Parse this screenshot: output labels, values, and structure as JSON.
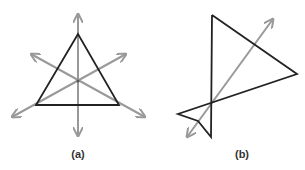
{
  "figures": [
    {
      "id": "a",
      "label": "(a)",
      "description": "Equilateral triangle with its three lines of symmetry drawn as double-headed gray arrows meeting at the centroid",
      "triangle": [
        [
          78,
          34
        ],
        [
          36,
          105
        ],
        [
          119,
          105
        ]
      ],
      "axes": [
        [
          [
            78,
            14
          ],
          [
            78,
            136
          ]
        ],
        [
          [
            12,
            117
          ],
          [
            126,
            54
          ]
        ],
        [
          [
            31,
            54
          ],
          [
            145,
            117
          ]
        ]
      ],
      "center": [
        78,
        81
      ]
    },
    {
      "id": "b",
      "label": "(b)",
      "description": "Irregular self-intersecting polygon (triangle with a small bowtie tail) with one double-headed gray arrow crossing it",
      "polygon": [
        [
          212,
          15
        ],
        [
          297,
          74
        ],
        [
          178,
          114
        ],
        [
          198,
          121
        ],
        [
          211,
          137
        ],
        [
          212,
          15
        ]
      ],
      "axes": [
        [
          [
            187,
            137
          ],
          [
            273,
            19
          ]
        ]
      ]
    }
  ],
  "colors": {
    "shape_stroke": "#222222",
    "axis_stroke": "#999999",
    "label": "#333333"
  }
}
